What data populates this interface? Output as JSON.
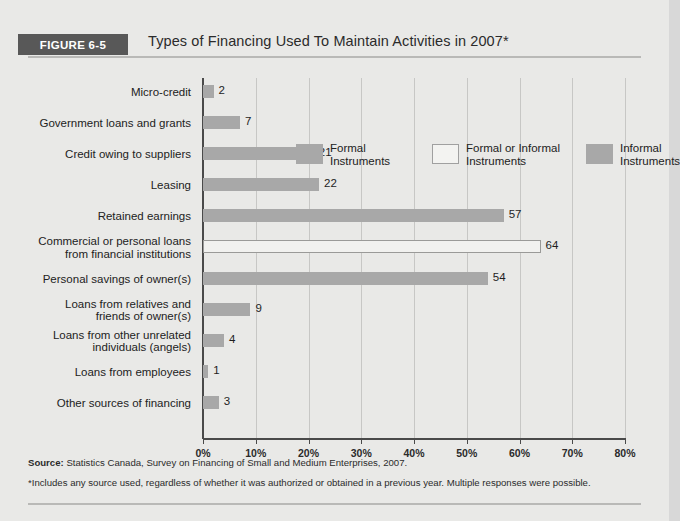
{
  "figure": {
    "tag": "FIGURE 6-5",
    "title": "Types of Financing Used To Maintain Activities in 2007*"
  },
  "legend": {
    "items": [
      {
        "label_line1": "Formal",
        "label_line2": "Instruments",
        "swatch": "formal",
        "color": "#a8a8a8"
      },
      {
        "label_line1": "Formal or Informal",
        "label_line2": "Instruments",
        "swatch": "mixed",
        "color": "#f3f3f1"
      },
      {
        "label_line1": "Informal",
        "label_line2": "Instruments",
        "swatch": "informal",
        "color": "#a8a8a8"
      }
    ]
  },
  "notes": {
    "source_label": "Source:",
    "source_text": " Statistics Canada, Survey on Financing of Small and Medium Enterprises, 2007.",
    "footnote": "*Includes any source used, regardless of whether it was authorized or obtained in a previous year. Multiple responses were possible."
  },
  "chart_data": {
    "type": "bar",
    "orientation": "horizontal",
    "title": "Types of Financing Used To Maintain Activities in 2007*",
    "xlabel": "",
    "ylabel": "",
    "xlim": [
      0,
      80
    ],
    "grid": true,
    "legend_position": "top-right",
    "tick_labels": [
      "0%",
      "10%",
      "20%",
      "30%",
      "40%",
      "50%",
      "60%",
      "70%",
      "80%"
    ],
    "tick_values": [
      0,
      10,
      20,
      30,
      40,
      50,
      60,
      70,
      80
    ],
    "categories": [
      "Micro-credit",
      "Government loans and grants",
      "Credit owing to suppliers",
      "Leasing",
      "Retained earnings",
      "Commercial or personal loans from financial institutions",
      "Personal savings of owner(s)",
      "Loans from relatives and friends of owner(s)",
      "Loans from other unrelated individuals (angels)",
      "Loans from employees",
      "Other sources of financing"
    ],
    "values": [
      2,
      7,
      21,
      22,
      57,
      64,
      54,
      9,
      4,
      1,
      3
    ],
    "value_labels": [
      "2",
      "7",
      "21",
      "22",
      "57",
      "64",
      "54",
      "9",
      "4",
      "1",
      "3"
    ],
    "series_group": [
      "formal",
      "formal",
      "formal",
      "formal",
      "informal",
      "mixed",
      "informal",
      "informal",
      "informal",
      "informal",
      "informal"
    ],
    "rows": [
      {
        "label_lines": [
          "Micro-credit"
        ],
        "value": 2,
        "value_label": "2",
        "group": "formal"
      },
      {
        "label_lines": [
          "Government loans and grants"
        ],
        "value": 7,
        "value_label": "7",
        "group": "formal"
      },
      {
        "label_lines": [
          "Credit owing to suppliers"
        ],
        "value": 21,
        "value_label": "21",
        "group": "formal"
      },
      {
        "label_lines": [
          "Leasing"
        ],
        "value": 22,
        "value_label": "22",
        "group": "formal"
      },
      {
        "label_lines": [
          "Retained earnings"
        ],
        "value": 57,
        "value_label": "57",
        "group": "informal"
      },
      {
        "label_lines": [
          "Commercial or personal loans",
          "from financial institutions"
        ],
        "value": 64,
        "value_label": "64",
        "group": "mixed"
      },
      {
        "label_lines": [
          "Personal savings of owner(s)"
        ],
        "value": 54,
        "value_label": "54",
        "group": "informal"
      },
      {
        "label_lines": [
          "Loans from relatives and",
          "friends of owner(s)"
        ],
        "value": 9,
        "value_label": "9",
        "group": "informal"
      },
      {
        "label_lines": [
          "Loans from other unrelated",
          "individuals (angels)"
        ],
        "value": 4,
        "value_label": "4",
        "group": "informal"
      },
      {
        "label_lines": [
          "Loans from employees"
        ],
        "value": 1,
        "value_label": "1",
        "group": "informal"
      },
      {
        "label_lines": [
          "Other sources of financing"
        ],
        "value": 3,
        "value_label": "3",
        "group": "informal"
      }
    ]
  }
}
